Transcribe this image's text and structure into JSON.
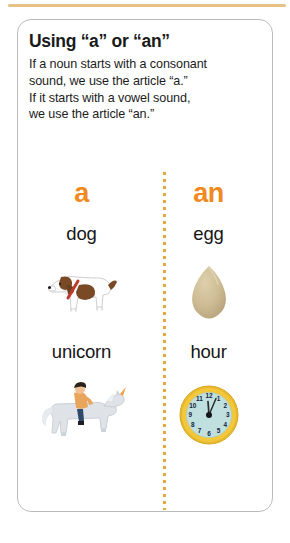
{
  "top_rule": {
    "color": "#e8c187"
  },
  "card": {
    "title": "Using “a” or “an”",
    "body_lines": [
      "If a noun starts with a consonant",
      "sound, we use the article “a.”",
      "If it starts with a vowel sound,",
      "we use the article “an.”"
    ]
  },
  "colors": {
    "accent_orange": "#f08a20",
    "divider_orange": "#e5a83d",
    "card_border": "#b9bcbe",
    "text": "#1a1a1a",
    "egg_fill": "#cdbb93",
    "clock_rim": "#f2c73c",
    "clock_face": "#bfe0df",
    "dog_patch": "#7a4a27",
    "dog_collar": "#c0392b",
    "unicorn_body": "#dfe3e8",
    "rider_shirt": "#e8a55c",
    "rider_pants": "#2f4a6d"
  },
  "comparison": {
    "columns": [
      {
        "article": "a",
        "words": [
          "dog",
          "unicorn"
        ]
      },
      {
        "article": "an",
        "words": [
          "egg",
          "hour"
        ]
      }
    ],
    "illustrations": [
      {
        "name": "dog-illustration",
        "alt": "dog"
      },
      {
        "name": "egg-illustration",
        "alt": "egg"
      },
      {
        "name": "unicorn-rider-illustration",
        "alt": "unicorn"
      },
      {
        "name": "clock-illustration",
        "alt": "hour"
      }
    ],
    "clock": {
      "numerals": [
        "12",
        "1",
        "2",
        "3",
        "4",
        "5",
        "6",
        "7",
        "8",
        "9",
        "10",
        "11"
      ],
      "hour_hand": "12",
      "minute_hand": "1"
    }
  }
}
